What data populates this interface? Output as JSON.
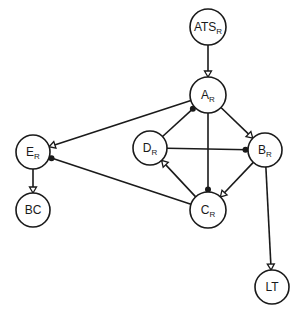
{
  "diagram": {
    "type": "directed graph",
    "colors": {
      "stroke": "#1a1a1a",
      "background": "#ffffff"
    },
    "nodes": [
      {
        "id": "ATS",
        "label": "ATS",
        "subscript": "R",
        "x": 208,
        "y": 27,
        "r": 18
      },
      {
        "id": "A",
        "label": "A",
        "subscript": "R",
        "x": 208,
        "y": 95,
        "r": 18
      },
      {
        "id": "D",
        "label": "D",
        "subscript": "R",
        "x": 150,
        "y": 148,
        "r": 17
      },
      {
        "id": "B",
        "label": "B",
        "subscript": "R",
        "x": 265,
        "y": 150,
        "r": 17
      },
      {
        "id": "E",
        "label": "E",
        "subscript": "R",
        "x": 33,
        "y": 152,
        "r": 17
      },
      {
        "id": "C",
        "label": "C",
        "subscript": "R",
        "x": 208,
        "y": 210,
        "r": 18
      },
      {
        "id": "BC",
        "label": "BC",
        "subscript": "",
        "x": 33,
        "y": 210,
        "r": 17
      },
      {
        "id": "LT",
        "label": "LT",
        "subscript": "",
        "x": 272,
        "y": 287,
        "r": 17
      }
    ],
    "edges": [
      {
        "from": "ATS",
        "to": "A",
        "marker": "hollow-triangle",
        "marker_at": "A"
      },
      {
        "from": "A",
        "to": "E",
        "marker": "hollow-triangle",
        "marker_at": "E"
      },
      {
        "from": "D",
        "to": "A",
        "marker": "filled-dot",
        "marker_at": "A"
      },
      {
        "from": "A",
        "to": "B",
        "marker": "hollow-triangle",
        "marker_at": "B"
      },
      {
        "from": "A",
        "to": "C",
        "marker": "filled-dot",
        "marker_at": "C"
      },
      {
        "from": "D",
        "to": "B",
        "marker": "filled-dot",
        "marker_at": "B"
      },
      {
        "from": "C",
        "to": "D",
        "marker": "hollow-triangle",
        "marker_at": "D"
      },
      {
        "from": "B",
        "to": "C",
        "marker": "hollow-triangle",
        "marker_at": "C"
      },
      {
        "from": "C",
        "to": "E",
        "marker": "filled-dot",
        "marker_at": "E"
      },
      {
        "from": "E",
        "to": "BC",
        "marker": "hollow-triangle",
        "marker_at": "BC"
      },
      {
        "from": "B",
        "to": "LT",
        "marker": "hollow-triangle",
        "marker_at": "LT"
      }
    ]
  }
}
